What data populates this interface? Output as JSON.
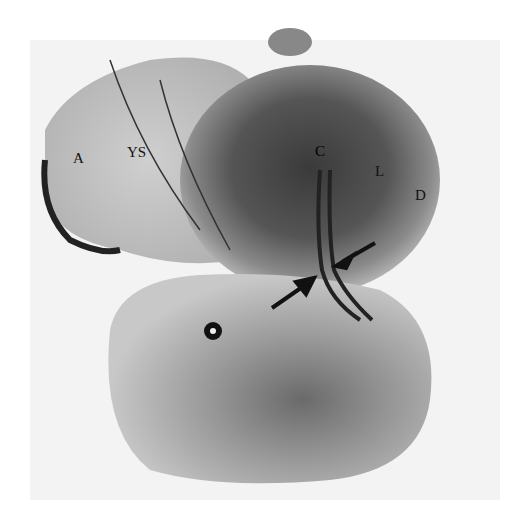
{
  "figure": {
    "labels": [
      {
        "id": "A",
        "text": "A"
      },
      {
        "id": "YS",
        "text": "YS"
      },
      {
        "id": "C",
        "text": "C"
      },
      {
        "id": "L",
        "text": "L"
      },
      {
        "id": "D",
        "text": "D"
      }
    ],
    "arrows": 2
  }
}
